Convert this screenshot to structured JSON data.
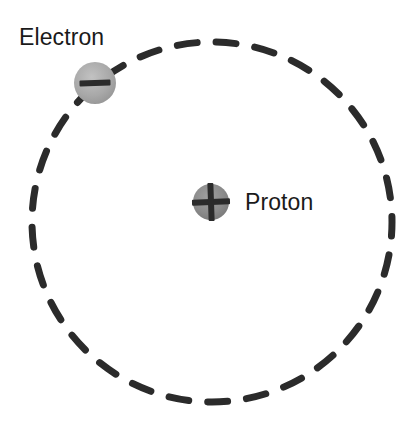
{
  "diagram": {
    "background_color": "#ffffff",
    "width": 418,
    "height": 431,
    "orbit": {
      "name": "electron-orbit",
      "style": "dashed",
      "center_x": 212,
      "center_y": 222,
      "radius": 180,
      "stroke_color": "#2b2b2b",
      "stroke_width": 7,
      "dash_length": 20,
      "dash_gap": 19
    },
    "particles": [
      {
        "id": "electron",
        "label": "Electron",
        "charge_symbol": "−",
        "charge_sign": "negative",
        "center_x": 95,
        "center_y": 83,
        "radius": 21,
        "fill_color": "#a6a6a6",
        "symbol_color": "#2b2b2b",
        "label_x": 19,
        "label_y": 26
      },
      {
        "id": "proton",
        "label": "Proton",
        "charge_symbol": "+",
        "charge_sign": "positive",
        "center_x": 211,
        "center_y": 202,
        "radius": 18,
        "fill_color": "#8a8a8a",
        "symbol_color": "#2b2b2b",
        "label_x": 245,
        "label_y": 191
      }
    ]
  }
}
